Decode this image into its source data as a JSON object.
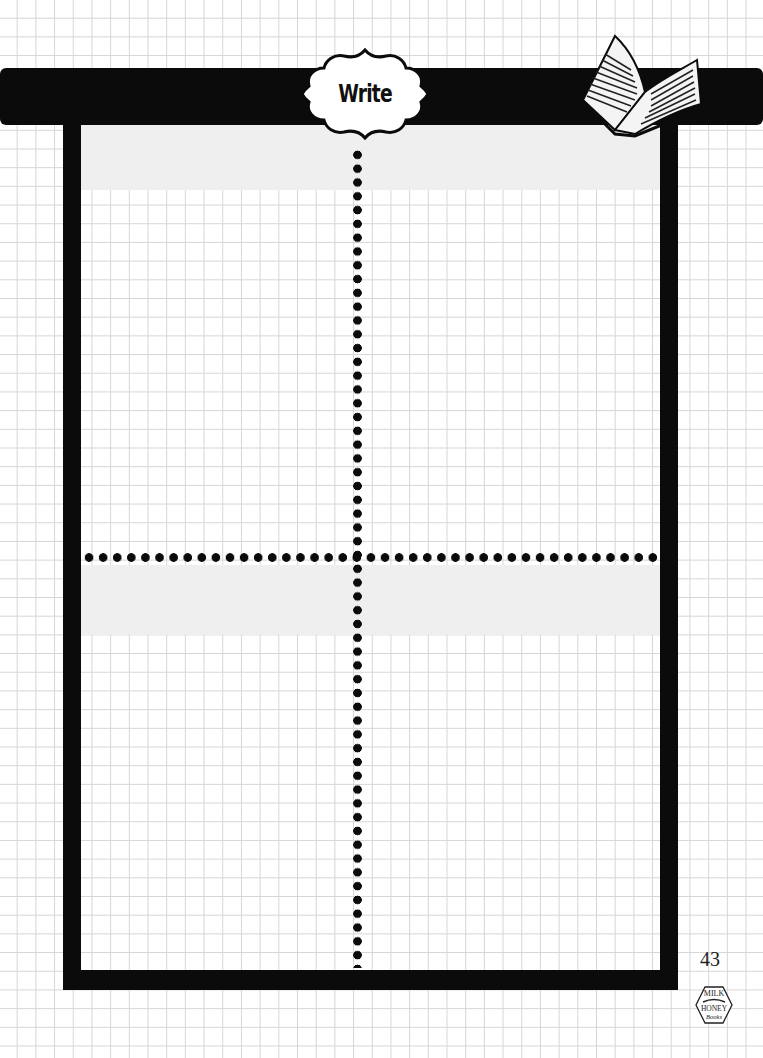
{
  "header": {
    "title": "Write",
    "icon": "open-book-icon"
  },
  "worksheet": {
    "sections": 4,
    "layout": "2x2 grid separated by dotted lines",
    "shaded_bands": [
      "top-header-band",
      "middle-header-band"
    ]
  },
  "footer": {
    "page_number": "43",
    "logo": {
      "line1": "MILK",
      "line2": "HONEY",
      "line3": "Books"
    }
  },
  "colors": {
    "ink": "#0b0b0b",
    "band": "#efefef",
    "grid": "#d6d6d6",
    "paper": "#ffffff"
  }
}
